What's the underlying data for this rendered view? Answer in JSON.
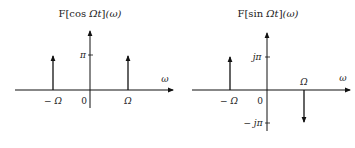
{
  "plots": [
    {
      "title": "F[cos Ωt](ω)",
      "title_prefix": "F",
      "title_fn": "cos ",
      "title_var": "Ωt",
      "title_arg": "(ω)",
      "y_tick_label": "π",
      "x_axis_label": "ω",
      "x_labels": {
        "neg": "− Ω",
        "zero": "0",
        "pos": "Ω"
      },
      "impulses": [
        {
          "at": "−Ω",
          "height": "π",
          "direction": "up"
        },
        {
          "at": "Ω",
          "height": "π",
          "direction": "up"
        }
      ]
    },
    {
      "title": "F[sin Ωt](ω)",
      "title_prefix": "F",
      "title_fn": "sin ",
      "title_var": "Ωt",
      "title_arg": "(ω)",
      "y_tick_label_pos": "jπ",
      "y_tick_label_neg": "− jπ",
      "x_axis_label": "ω",
      "x_labels": {
        "neg": "− Ω",
        "zero": "0",
        "pos": "Ω"
      },
      "impulses": [
        {
          "at": "−Ω",
          "height": "jπ",
          "direction": "up"
        },
        {
          "at": "Ω",
          "height": "−jπ",
          "direction": "down"
        }
      ]
    }
  ],
  "colors": {
    "stroke": "#111111",
    "text": "#222222",
    "background": "#ffffff"
  }
}
